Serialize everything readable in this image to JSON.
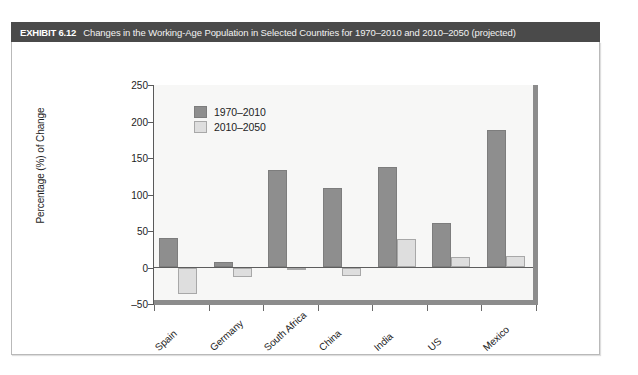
{
  "exhibit": {
    "number": "EXHIBIT 6.12",
    "title": "Changes in the Working-Age Population in Selected Countries for 1970–2010 and 2010–2050 (projected)",
    "header_bg": "#4a4a4a",
    "page_bg": "#ffffff"
  },
  "chart_data": {
    "type": "bar",
    "title": "",
    "xlabel": "",
    "ylabel": "Percentage (%) of Change",
    "ylim": [
      -50,
      250
    ],
    "yticks": [
      250,
      200,
      150,
      100,
      50,
      0,
      -50
    ],
    "ytick_labels": [
      "250",
      "200",
      "150",
      "100",
      "50",
      "0",
      "–50"
    ],
    "grid": false,
    "legend_position": "top-left",
    "categories": [
      "Spain",
      "Germany",
      "South Africa",
      "China",
      "India",
      "US",
      "Mexico"
    ],
    "series": [
      {
        "name": "1970–2010",
        "color": "#8e8e8e",
        "values": [
          41,
          7,
          134,
          109,
          138,
          61,
          188
        ]
      },
      {
        "name": "2010–2050",
        "color": "#dedede",
        "values": [
          -36,
          -13,
          -3,
          -11,
          39,
          14,
          16
        ]
      }
    ]
  }
}
